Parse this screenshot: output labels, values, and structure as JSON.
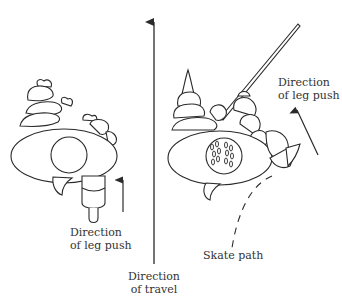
{
  "diagram": {
    "colors": {
      "stroke": "#2a2a2a",
      "text": "#333333",
      "background": "#ffffff"
    },
    "left_figure": {
      "label_line1": "Direction",
      "label_line2": "of leg push"
    },
    "center_arrow": {
      "label_line1": "Direction",
      "label_line2": "of travel"
    },
    "right_figure": {
      "push_label_line1": "Direction",
      "push_label_line2": "of leg push",
      "path_label": "Skate path"
    }
  }
}
